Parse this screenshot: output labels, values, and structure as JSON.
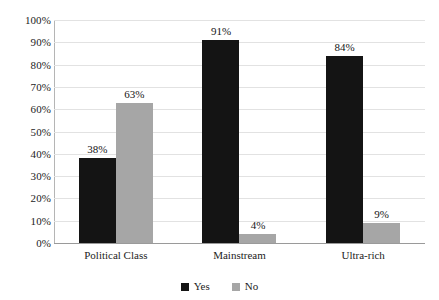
{
  "chart_data": {
    "type": "bar",
    "title": "",
    "subtitle": "",
    "xlabel": "",
    "ylabel": "",
    "categories": [
      "Political Class",
      "Mainstream",
      "Ultra-rich"
    ],
    "series": [
      {
        "name": "Yes",
        "color": "#141414",
        "values": [
          38,
          91,
          84
        ],
        "labels": [
          "38%",
          "91%",
          "84%"
        ]
      },
      {
        "name": "No",
        "color": "#a6a6a6",
        "values": [
          63,
          4,
          9
        ],
        "labels": [
          "63%",
          "4%",
          "9%"
        ]
      }
    ],
    "ylim": [
      0,
      100
    ],
    "y_tick_step": 10,
    "y_ticks": [
      100,
      90,
      80,
      70,
      60,
      50,
      40,
      30,
      20,
      10,
      0
    ],
    "y_tick_labels": [
      "100%",
      "90%",
      "80%",
      "70%",
      "60%",
      "50%",
      "40%",
      "30%",
      "20%",
      "10%",
      "0%"
    ],
    "grid": true,
    "grid_axis": "y",
    "legend_position": "bottom-center",
    "data_labels": true,
    "background_color": "#ffffff",
    "gridline_color": "#e2e2e2",
    "axis_color": "#b5b5b5",
    "text_color": "#1c1c1c"
  }
}
